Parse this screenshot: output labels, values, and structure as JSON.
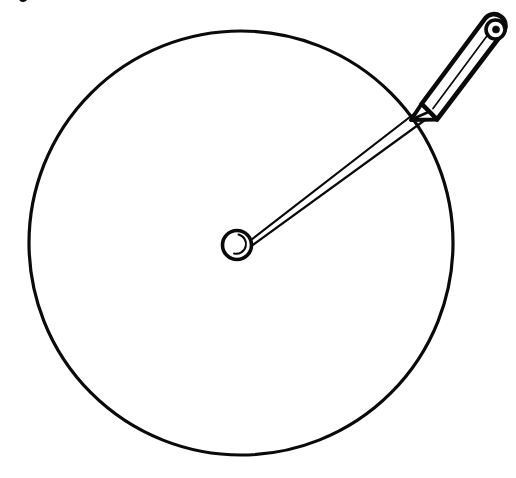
{
  "figure": {
    "caption_fragment": "9",
    "background_color": "#ffffff",
    "ink_color": "#0a0a0a",
    "canvas": {
      "width": 516,
      "height": 478
    }
  },
  "elements": {
    "drawn_circle": {
      "name": "drawn-circle",
      "center_x": 241,
      "center_y": 243,
      "radius": 212,
      "stroke_width": 3.2
    },
    "pivot": {
      "name": "compass-pivot",
      "center_x": 237,
      "center_y": 245,
      "outer_radius": 15,
      "stroke_width": 3.4,
      "highlight_arc": "inner crescent lower-right"
    },
    "arm": {
      "name": "compass-arm",
      "from_x": 250,
      "from_y": 242,
      "to_x": 424,
      "to_y": 108,
      "line_count": 2,
      "stroke_width": 2.2
    },
    "pencil": {
      "name": "pencil",
      "tip_x": 417,
      "tip_y": 113,
      "cap_x": 497,
      "cap_y": 30,
      "body_width": 22,
      "outline_width": 4.5,
      "cap_hole_radius": 3.6,
      "has_inner_highlight_line": true
    }
  },
  "chart_data": {
    "type": "scatter",
    "xlabel": "",
    "ylabel": "",
    "xlim": [
      0,
      516
    ],
    "ylim": [
      0,
      478
    ],
    "grid": false,
    "legend": "none",
    "annotations": [
      {
        "label": "circle center",
        "x": 241,
        "y": 243
      },
      {
        "label": "circle radius",
        "x": 212,
        "y": 0
      },
      {
        "label": "pencil tip on circumference",
        "x": 417,
        "y": 113
      },
      {
        "label": "pencil cap",
        "x": 497,
        "y": 30
      }
    ],
    "series": [
      {
        "name": "drawn circle",
        "values": [
          {
            "cx": 241,
            "cy": 243,
            "r": 212
          }
        ]
      },
      {
        "name": "compass pivot",
        "values": [
          {
            "cx": 237,
            "cy": 245,
            "r": 15
          }
        ]
      }
    ]
  }
}
